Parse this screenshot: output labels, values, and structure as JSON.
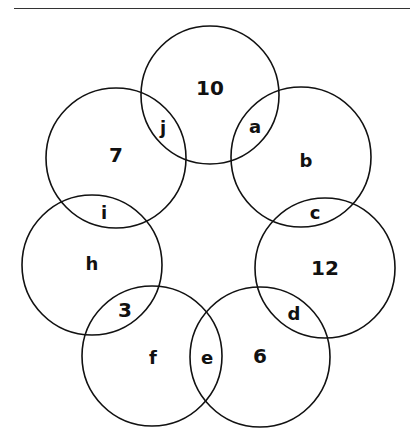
{
  "header": {
    "clipped_text": [
      "",
      ""
    ]
  },
  "diagram": {
    "stroke_color": "#111111",
    "circles": [
      {
        "id": "top",
        "cx": 210,
        "cy": 95,
        "r": 69
      },
      {
        "id": "upper-left",
        "cx": 116,
        "cy": 158,
        "r": 70
      },
      {
        "id": "upper-right",
        "cx": 301,
        "cy": 157,
        "r": 70
      },
      {
        "id": "mid-left",
        "cx": 92,
        "cy": 265,
        "r": 70
      },
      {
        "id": "mid-right",
        "cx": 325,
        "cy": 268,
        "r": 70
      },
      {
        "id": "bottom-left",
        "cx": 152,
        "cy": 356,
        "r": 70
      },
      {
        "id": "bottom-right",
        "cx": 260,
        "cy": 357,
        "r": 70
      }
    ],
    "labels": [
      {
        "text": "10",
        "x": 210,
        "y": 88,
        "size": 20
      },
      {
        "text": "j",
        "x": 163,
        "y": 127,
        "size": 18
      },
      {
        "text": "a",
        "x": 255,
        "y": 126,
        "size": 18
      },
      {
        "text": "7",
        "x": 116,
        "y": 155,
        "size": 20
      },
      {
        "text": "b",
        "x": 306,
        "y": 160,
        "size": 18
      },
      {
        "text": "i",
        "x": 104,
        "y": 212,
        "size": 18
      },
      {
        "text": "c",
        "x": 315,
        "y": 212,
        "size": 18
      },
      {
        "text": "h",
        "x": 92,
        "y": 263,
        "size": 18
      },
      {
        "text": "12",
        "x": 325,
        "y": 268,
        "size": 20
      },
      {
        "text": "3",
        "x": 125,
        "y": 310,
        "size": 20
      },
      {
        "text": "d",
        "x": 294,
        "y": 313,
        "size": 18
      },
      {
        "text": "f",
        "x": 153,
        "y": 357,
        "size": 18
      },
      {
        "text": "e",
        "x": 207,
        "y": 357,
        "size": 18
      },
      {
        "text": "6",
        "x": 260,
        "y": 356,
        "size": 20
      }
    ]
  }
}
